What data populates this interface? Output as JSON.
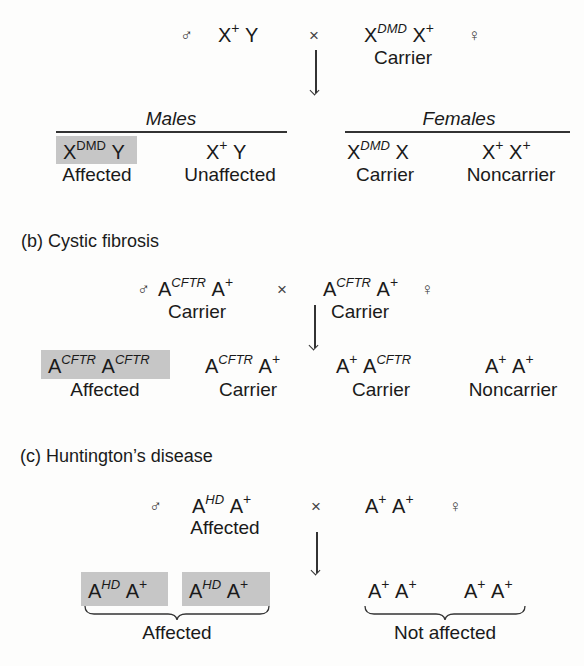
{
  "panel_a": {
    "title": "",
    "cross": {
      "male_symbol": "♂",
      "male_genotype": {
        "base1": "X",
        "sup1": "+",
        "base2": "Y"
      },
      "cross_symbol": "×",
      "female_genotype": {
        "base1": "X",
        "sup1": "DMD",
        "base2": "X",
        "sup2": "+"
      },
      "female_label": "Carrier",
      "female_symbol": "♀"
    },
    "groups": {
      "males_header": "Males",
      "females_header": "Females"
    },
    "offspring": [
      {
        "base1": "X",
        "sup1": "DMD",
        "base2": "Y",
        "sup2": "",
        "label": "Affected",
        "shaded": true
      },
      {
        "base1": "X",
        "sup1": "+",
        "base2": "Y",
        "sup2": "",
        "label": "Unaffected",
        "shaded": false
      },
      {
        "base1": "X",
        "sup1": "DMD",
        "base2": "X",
        "sup2": "",
        "label": "Carrier",
        "shaded": false
      },
      {
        "base1": "X",
        "sup1": "+",
        "base2": "X",
        "sup2": "+",
        "label": "Noncarrier",
        "shaded": false
      }
    ]
  },
  "panel_b": {
    "title": "(b) Cystic fibrosis",
    "cross": {
      "male_symbol": "♂",
      "male_genotype": {
        "base1": "A",
        "sup1": "CFTR",
        "base2": "A",
        "sup2": "+"
      },
      "male_label": "Carrier",
      "cross_symbol": "×",
      "female_genotype": {
        "base1": "A",
        "sup1": "CFTR",
        "base2": "A",
        "sup2": "+"
      },
      "female_label": "Carrier",
      "female_symbol": "♀"
    },
    "offspring": [
      {
        "base1": "A",
        "sup1": "CFTR",
        "base2": "A",
        "sup2": "CFTR",
        "label": "Affected",
        "shaded": true
      },
      {
        "base1": "A",
        "sup1": "CFTR",
        "base2": "A",
        "sup2": "+",
        "label": "Carrier",
        "shaded": false
      },
      {
        "base1": "A",
        "sup1": "+",
        "base2": "A",
        "sup2": "CFTR",
        "label": "Carrier",
        "shaded": false
      },
      {
        "base1": "A",
        "sup1": "+",
        "base2": "A",
        "sup2": "+",
        "label": "Noncarrier",
        "shaded": false
      }
    ]
  },
  "panel_c": {
    "title": "(c) Huntington’s disease",
    "cross": {
      "male_symbol": "♂",
      "male_genotype": {
        "base1": "A",
        "sup1": "HD",
        "base2": "A",
        "sup2": "+"
      },
      "male_label": "Affected",
      "cross_symbol": "×",
      "female_genotype": {
        "base1": "A",
        "sup1": "+",
        "base2": "A",
        "sup2": "+"
      },
      "female_symbol": "♀"
    },
    "offspring": [
      {
        "base1": "A",
        "sup1": "HD",
        "base2": "A",
        "sup2": "+",
        "shaded": true
      },
      {
        "base1": "A",
        "sup1": "HD",
        "base2": "A",
        "sup2": "+",
        "shaded": true
      },
      {
        "base1": "A",
        "sup1": "+",
        "base2": "A",
        "sup2": "+",
        "shaded": false
      },
      {
        "base1": "A",
        "sup1": "+",
        "base2": "A",
        "sup2": "+",
        "shaded": false
      }
    ],
    "group_labels": {
      "affected": "Affected",
      "not_affected": "Not affected"
    }
  },
  "colors": {
    "shade": "#c6c6c6",
    "text": "#1a1a1a",
    "background": "#fdfdfc"
  }
}
